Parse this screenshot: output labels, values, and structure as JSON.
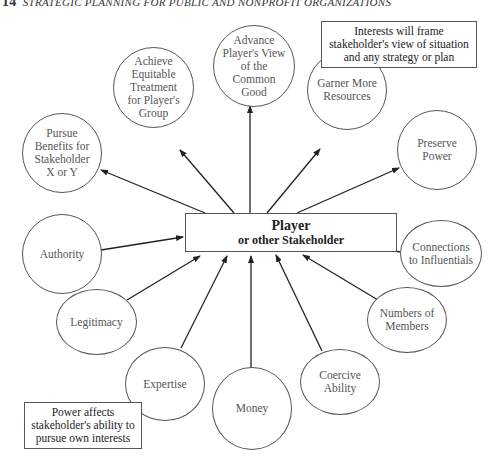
{
  "header": {
    "page_number": "14",
    "running_title": "STRATEGIC PLANNING FOR PUBLIC AND NONPROFIT ORGANIZATIONS"
  },
  "center": {
    "title": "Player",
    "subtitle": "or other Stakeholder"
  },
  "interests": [
    {
      "id": "pursue-benefits",
      "label": "Pursue\nBenefits for\nStakeholder\nX or Y"
    },
    {
      "id": "achieve-equitable",
      "label": "Achieve\nEquitable\nTreatment\nfor Player's\nGroup"
    },
    {
      "id": "advance-common-good",
      "label": "Advance\nPlayer's View\nof the\nCommon\nGood"
    },
    {
      "id": "garner-resources",
      "label": "Garner More\nResources"
    },
    {
      "id": "preserve-power",
      "label": "Preserve\nPower"
    }
  ],
  "power_sources": [
    {
      "id": "authority",
      "label": "Authority"
    },
    {
      "id": "legitimacy",
      "label": "Legitimacy"
    },
    {
      "id": "expertise",
      "label": "Expertise"
    },
    {
      "id": "money",
      "label": "Money"
    },
    {
      "id": "coercive-ability",
      "label": "Coercive\nAbility"
    },
    {
      "id": "numbers-of-members",
      "label": "Numbers of\nMembers"
    },
    {
      "id": "connections",
      "label": "Connections\nto Influentials"
    }
  ],
  "notes": {
    "interests_note": "Interests will frame\nstakeholder's view of situation\nand any strategy or plan",
    "power_note": "Power affects\nstakeholder's ability to\npursue own interests"
  },
  "colors": {
    "line": "#222222",
    "circle_border": "#555555",
    "text": "#555555",
    "background": "#ffffff"
  }
}
